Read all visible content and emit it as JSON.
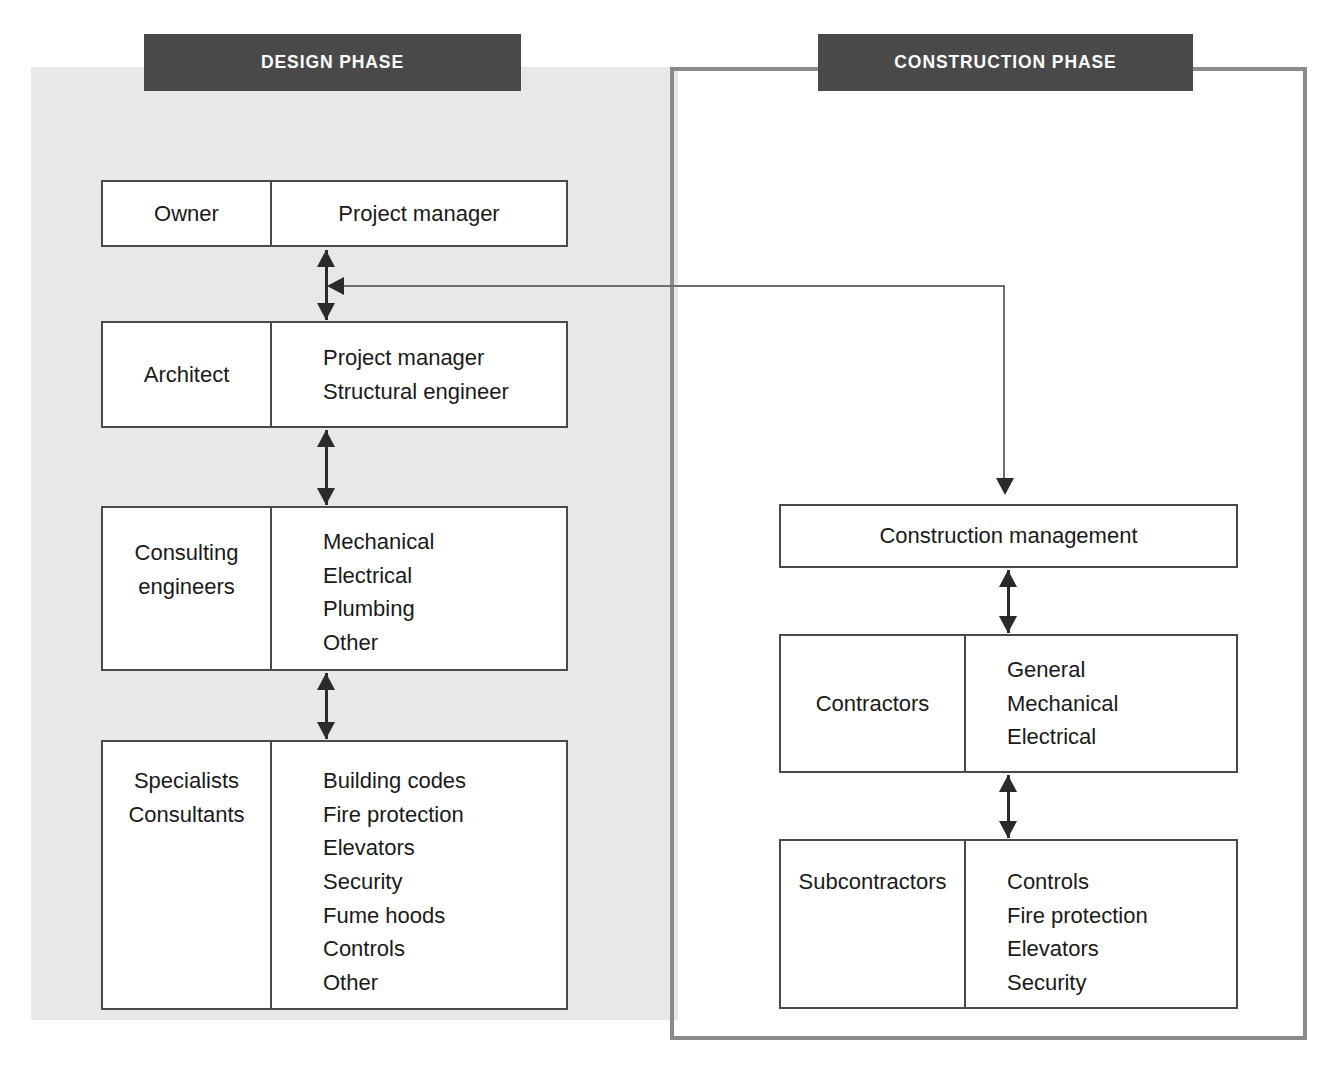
{
  "diagram": {
    "phases": [
      {
        "id": "design",
        "label": "DESIGN PHASE"
      },
      {
        "id": "construction",
        "label": "CONSTRUCTION PHASE"
      }
    ],
    "colors": {
      "banner_background": "#494949",
      "banner_text": "#ffffff",
      "design_panel_background": "#e8e8e8",
      "construction_panel_border": "#8a8a8a",
      "box_border": "#4a4a4a",
      "box_background": "#ffffff",
      "connector": "#2b2b2b",
      "text": "#1a1a1a"
    },
    "design_boxes": [
      {
        "id": "owner",
        "role": "Owner",
        "members": [
          "Project manager"
        ]
      },
      {
        "id": "architect",
        "role": "Architect",
        "members": [
          "Project manager",
          "Structural engineer"
        ]
      },
      {
        "id": "consulting-engineers",
        "role_lines": [
          "Consulting",
          "engineers"
        ],
        "members": [
          "Mechanical",
          "Electrical",
          "Plumbing",
          "Other"
        ]
      },
      {
        "id": "specialists-consultants",
        "role_lines": [
          "Specialists",
          "Consultants"
        ],
        "members": [
          "Building codes",
          "Fire protection",
          "Elevators",
          "Security",
          "Fume hoods",
          "Controls",
          "Other"
        ]
      }
    ],
    "construction_boxes": [
      {
        "id": "construction-management",
        "label": "Construction management"
      },
      {
        "id": "contractors",
        "role": "Contractors",
        "members": [
          "General",
          "Mechanical",
          "Electrical"
        ]
      },
      {
        "id": "subcontractors",
        "role": "Subcontractors",
        "members": [
          "Controls",
          "Fire protection",
          "Elevators",
          "Security"
        ]
      }
    ],
    "connectors": [
      {
        "id": "owner-architect",
        "from": "owner",
        "to": "architect",
        "style": "double-arrow"
      },
      {
        "id": "architect-consulting",
        "from": "architect",
        "to": "consulting-engineers",
        "style": "double-arrow"
      },
      {
        "id": "consulting-specialists",
        "from": "consulting-engineers",
        "to": "specialists-consultants",
        "style": "double-arrow"
      },
      {
        "id": "owner-construction-management",
        "from": "owner",
        "to": "construction-management",
        "style": "elbow-arrow-both-ends"
      },
      {
        "id": "cm-contractors",
        "from": "construction-management",
        "to": "contractors",
        "style": "double-arrow"
      },
      {
        "id": "contractors-subcontractors",
        "from": "contractors",
        "to": "subcontractors",
        "style": "double-arrow"
      }
    ]
  }
}
